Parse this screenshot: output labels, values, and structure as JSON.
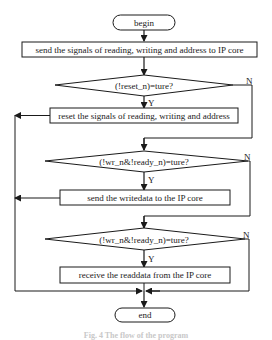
{
  "flowchart": {
    "start": {
      "label": "begin"
    },
    "steps": [
      {
        "id": "send_signals",
        "type": "process",
        "label": "send the signals of reading, writing and address to IP core"
      },
      {
        "id": "check_reset",
        "type": "decision",
        "label": "(!reset_n)=ture?",
        "yes": "Y",
        "no": "N"
      },
      {
        "id": "reset_signals",
        "type": "process",
        "label": "reset the signals of reading, writing and address"
      },
      {
        "id": "check_write",
        "type": "decision",
        "label": "(!wr_n&!ready_n)=ture?",
        "yes": "Y",
        "no": "N"
      },
      {
        "id": "send_writedata",
        "type": "process",
        "label": "send the writedata to the IP core"
      },
      {
        "id": "check_read",
        "type": "decision",
        "label": "(!wr_n&!ready_n)=ture?",
        "yes": "Y",
        "no": "N"
      },
      {
        "id": "receive_readdata",
        "type": "process",
        "label": "receive the readdata from the IP core"
      }
    ],
    "end": {
      "label": "end"
    },
    "caption": "Fig. 4  The flow of the program"
  },
  "colors": {
    "stroke": "#1a1a1a",
    "background": "#ffffff",
    "caption": "#c8c8c8"
  }
}
